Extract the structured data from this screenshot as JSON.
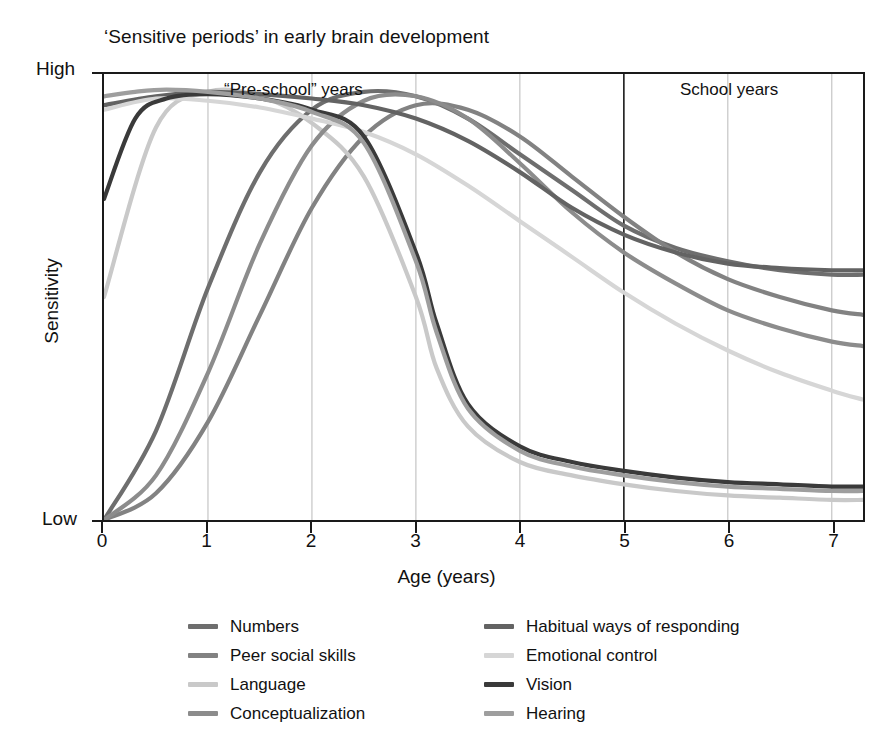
{
  "chart_data": {
    "type": "line",
    "title": "‘Sensitive periods’ in early brain development",
    "xlabel": "Age (years)",
    "ylabel": "Sensitivity",
    "xlim": [
      0,
      7.3
    ],
    "ylim": [
      0,
      1
    ],
    "xticks": [
      "0",
      "1",
      "2",
      "3",
      "4",
      "5",
      "6",
      "7"
    ],
    "yticks": [
      "Low",
      "High"
    ],
    "grid": "vertical-at-integer-years",
    "legend_position": "below-axes-two-columns",
    "annotations": [
      {
        "text": "“Pre-school” years",
        "x": 1.6,
        "y": 0.98
      },
      {
        "text": "School years",
        "x": 5.8,
        "y": 0.98
      }
    ],
    "series": [
      {
        "name": "Numbers",
        "color": "#6e6e6e",
        "x": [
          0,
          0.5,
          1,
          1.5,
          2,
          2.5,
          3,
          3.5,
          4,
          4.5,
          5,
          5.5,
          6,
          6.5,
          7,
          7.3
        ],
        "values": [
          0.0,
          0.2,
          0.52,
          0.78,
          0.92,
          0.96,
          0.95,
          0.9,
          0.82,
          0.74,
          0.66,
          0.61,
          0.58,
          0.56,
          0.55,
          0.55
        ]
      },
      {
        "name": "Peer social skills",
        "color": "#828282",
        "x": [
          0,
          0.5,
          1,
          1.5,
          2,
          2.5,
          3,
          3.5,
          4,
          4.5,
          5,
          5.5,
          6,
          6.5,
          7,
          7.3
        ],
        "values": [
          0.0,
          0.06,
          0.22,
          0.46,
          0.7,
          0.86,
          0.93,
          0.92,
          0.86,
          0.77,
          0.68,
          0.6,
          0.54,
          0.5,
          0.47,
          0.46
        ]
      },
      {
        "name": "Language",
        "color": "#c9c9c9",
        "x": [
          0,
          0.5,
          1,
          1.5,
          2,
          2.5,
          3,
          3.2,
          3.5,
          4,
          4.5,
          5,
          5.5,
          6,
          6.5,
          7,
          7.3
        ],
        "values": [
          0.5,
          0.88,
          0.96,
          0.95,
          0.89,
          0.77,
          0.5,
          0.34,
          0.21,
          0.13,
          0.1,
          0.08,
          0.065,
          0.055,
          0.05,
          0.045,
          0.045
        ]
      },
      {
        "name": "Conceptualization",
        "color": "#8c8c8c",
        "x": [
          0,
          0.5,
          1,
          1.5,
          2,
          2.5,
          3,
          3.5,
          4,
          4.5,
          5,
          5.5,
          6,
          6.5,
          7,
          7.3
        ],
        "values": [
          0.0,
          0.1,
          0.33,
          0.62,
          0.84,
          0.94,
          0.95,
          0.9,
          0.8,
          0.69,
          0.6,
          0.53,
          0.47,
          0.43,
          0.4,
          0.39
        ]
      },
      {
        "name": "Habitual ways of responding",
        "color": "#636363",
        "x": [
          0,
          0.5,
          1,
          1.5,
          2,
          2.5,
          3,
          3.5,
          4,
          4.5,
          5,
          5.5,
          6,
          6.5,
          7,
          7.3
        ],
        "values": [
          0.93,
          0.95,
          0.96,
          0.955,
          0.945,
          0.93,
          0.9,
          0.85,
          0.78,
          0.7,
          0.64,
          0.6,
          0.575,
          0.565,
          0.56,
          0.56
        ]
      },
      {
        "name": "Emotional control",
        "color": "#d6d6d6",
        "x": [
          0,
          0.5,
          1,
          1.5,
          2,
          2.5,
          3,
          3.5,
          4,
          4.5,
          5,
          5.5,
          6,
          6.5,
          7,
          7.3
        ],
        "values": [
          0.92,
          0.945,
          0.94,
          0.925,
          0.9,
          0.87,
          0.82,
          0.75,
          0.67,
          0.59,
          0.51,
          0.44,
          0.38,
          0.33,
          0.29,
          0.27
        ]
      },
      {
        "name": "Vision",
        "color": "#3a3a3a",
        "x": [
          0,
          0.3,
          0.6,
          1,
          1.5,
          2,
          2.5,
          3,
          3.2,
          3.5,
          4,
          4.5,
          5,
          5.5,
          6,
          6.5,
          7,
          7.3
        ],
        "values": [
          0.72,
          0.9,
          0.945,
          0.955,
          0.945,
          0.92,
          0.86,
          0.6,
          0.44,
          0.26,
          0.165,
          0.13,
          0.11,
          0.095,
          0.085,
          0.08,
          0.075,
          0.075
        ]
      },
      {
        "name": "Hearing",
        "color": "#9e9e9e",
        "x": [
          0,
          0.3,
          0.6,
          1,
          1.5,
          2,
          2.5,
          3,
          3.2,
          3.5,
          4,
          4.5,
          5,
          5.5,
          6,
          6.5,
          7,
          7.3
        ],
        "values": [
          0.95,
          0.96,
          0.965,
          0.96,
          0.945,
          0.915,
          0.845,
          0.58,
          0.42,
          0.25,
          0.155,
          0.12,
          0.1,
          0.085,
          0.075,
          0.07,
          0.065,
          0.065
        ]
      }
    ]
  },
  "legend": {
    "columns": [
      [
        "Numbers",
        "Peer social skills",
        "Language",
        "Conceptualization"
      ],
      [
        "Habitual ways of responding",
        "Emotional control",
        "Vision",
        "Hearing"
      ]
    ]
  }
}
